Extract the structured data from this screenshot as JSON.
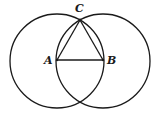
{
  "diagram": {
    "title": "",
    "stroke_color": "#1a1a1a",
    "background": "#ffffff",
    "points": {
      "A": {
        "label": "A",
        "x": 57,
        "y": 60
      },
      "B": {
        "label": "B",
        "x": 103,
        "y": 60
      },
      "C": {
        "label": "C",
        "x": 80,
        "y": 20
      }
    },
    "circles": [
      {
        "name": "circle-centered-A",
        "cx": 57,
        "cy": 61,
        "r": 47
      },
      {
        "name": "circle-centered-B",
        "cx": 103,
        "cy": 61,
        "r": 47
      }
    ],
    "segments": [
      {
        "name": "segment-AB",
        "from": "A",
        "to": "B"
      },
      {
        "name": "segment-AC",
        "from": "A",
        "to": "C"
      },
      {
        "name": "segment-BC",
        "from": "B",
        "to": "C"
      }
    ],
    "labels": {
      "A": "A",
      "B": "B",
      "C": "C"
    }
  }
}
